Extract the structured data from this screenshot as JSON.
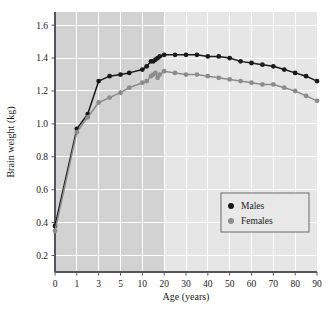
{
  "chart_data": {
    "type": "line",
    "title": "",
    "xlabel": "Age (years)",
    "ylabel": "Brain weight (kg)",
    "xlim": [
      0,
      90
    ],
    "ylim": [
      0.1,
      1.68
    ],
    "grid": true,
    "legend_position": "bottom-right",
    "x_axis_scale": "piecewise-compressed",
    "xticks": [
      0,
      1,
      3,
      5,
      10,
      20,
      30,
      40,
      50,
      60,
      70,
      80,
      90
    ],
    "xtick_labels": [
      "0",
      "1",
      "3",
      "5",
      "10",
      "20",
      "30",
      "40",
      "50",
      "60",
      "70",
      "80",
      "90"
    ],
    "yticks": [
      0.2,
      0.4,
      0.6,
      0.8,
      1.0,
      1.2,
      1.4,
      1.6
    ],
    "ytick_labels": [
      "0.2",
      "0.4",
      "0.6",
      "0.8",
      "1.0",
      "1.2",
      "1.4",
      "1.6"
    ],
    "shaded_band": {
      "from": 0,
      "to": 20,
      "color": "#d2d2d2",
      "description": "darker band over compressed childhood ages"
    },
    "plot_background": "#e6e6e6",
    "gridline_color": "#ffffff",
    "series": [
      {
        "name": "Males",
        "color": "#1a1a1a",
        "marker": "circle",
        "x": [
          0,
          1,
          2,
          3,
          4,
          5,
          7,
          10,
          12,
          14,
          15,
          16,
          17,
          18,
          20,
          25,
          30,
          35,
          40,
          45,
          50,
          55,
          60,
          65,
          70,
          75,
          80,
          85,
          90
        ],
        "y": [
          0.38,
          0.97,
          1.06,
          1.26,
          1.29,
          1.3,
          1.31,
          1.33,
          1.35,
          1.38,
          1.38,
          1.39,
          1.4,
          1.41,
          1.42,
          1.42,
          1.42,
          1.42,
          1.41,
          1.41,
          1.4,
          1.38,
          1.37,
          1.36,
          1.35,
          1.33,
          1.31,
          1.29,
          1.26
        ]
      },
      {
        "name": "Females",
        "color": "#8c8c8c",
        "marker": "circle",
        "x": [
          0,
          1,
          2,
          3,
          4,
          5,
          7,
          10,
          12,
          14,
          15,
          16,
          17,
          18,
          20,
          25,
          30,
          35,
          40,
          45,
          50,
          55,
          60,
          65,
          70,
          75,
          80,
          85,
          90
        ],
        "y": [
          0.35,
          0.95,
          1.04,
          1.13,
          1.16,
          1.19,
          1.22,
          1.25,
          1.26,
          1.29,
          1.3,
          1.31,
          1.28,
          1.3,
          1.32,
          1.31,
          1.3,
          1.3,
          1.29,
          1.28,
          1.27,
          1.26,
          1.25,
          1.24,
          1.24,
          1.22,
          1.2,
          1.17,
          1.14
        ]
      }
    ]
  },
  "legend": {
    "items": [
      {
        "label": "Males",
        "color": "#1a1a1a"
      },
      {
        "label": "Females",
        "color": "#8c8c8c"
      }
    ]
  },
  "axes": {
    "x_title": "Age (years)",
    "y_title": "Brain weight (kg)"
  }
}
